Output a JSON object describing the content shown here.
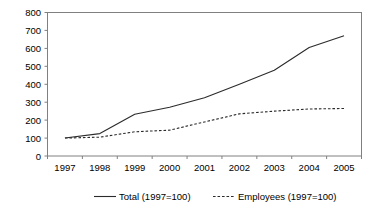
{
  "chart_data": {
    "type": "line",
    "title": "",
    "subtitle": "",
    "xlabel": "",
    "ylabel": "",
    "categories": [
      "1997",
      "1998",
      "1999",
      "2000",
      "2001",
      "2002",
      "2003",
      "2004",
      "2005"
    ],
    "series": [
      {
        "name": "Total (1997=100)",
        "style": "solid",
        "color": "#2b2b2b",
        "values": [
          100,
          125,
          233,
          272,
          325,
          400,
          478,
          605,
          670
        ]
      },
      {
        "name": "Employees (1997=100)",
        "style": "dashed",
        "color": "#2b2b2b",
        "values": [
          100,
          105,
          135,
          144,
          190,
          235,
          250,
          262,
          265
        ]
      }
    ],
    "ylim": [
      0,
      800
    ],
    "ytick_labels": [
      "0",
      "100",
      "200",
      "300",
      "400",
      "500",
      "600",
      "700",
      "800"
    ],
    "ytick_values": [
      0,
      100,
      200,
      300,
      400,
      500,
      600,
      700,
      800
    ],
    "xtick_labels": [
      "1997",
      "1998",
      "1999",
      "2000",
      "2001",
      "2002",
      "2003",
      "2004",
      "2005"
    ],
    "grid": false,
    "legend_position": "bottom",
    "legend": [
      {
        "label": "Total (1997=100)",
        "style": "solid"
      },
      {
        "label": "Employees (1997=100)",
        "style": "dashed"
      }
    ],
    "annotations": [],
    "frame_color": "#808080",
    "background": "#ffffff"
  }
}
